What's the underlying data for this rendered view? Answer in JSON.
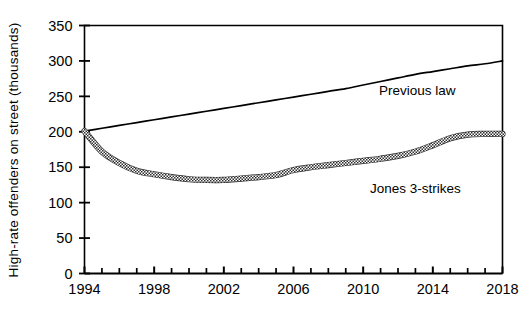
{
  "chart_data": {
    "type": "line",
    "title": "",
    "xlabel": "",
    "ylabel": "High-rate offenders on street (thousands)",
    "xlim": [
      1994,
      2018
    ],
    "ylim": [
      0,
      350
    ],
    "grid": false,
    "legend_position": "inline-annotation",
    "y_ticks": [
      0,
      50,
      100,
      150,
      200,
      250,
      300,
      350
    ],
    "y_tick_labels": [
      "0",
      "50",
      "100",
      "150",
      "200",
      "250",
      "300",
      "350"
    ],
    "x_ticks": [
      1994,
      1995,
      1996,
      1997,
      1998,
      1999,
      2000,
      2001,
      2002,
      2003,
      2004,
      2005,
      2006,
      2007,
      2008,
      2009,
      2010,
      2011,
      2012,
      2013,
      2014,
      2015,
      2016,
      2017,
      2018
    ],
    "x_tick_labels": [
      "1994",
      "",
      "",
      "",
      "1998",
      "",
      "",
      "",
      "2002",
      "",
      "",
      "",
      "2006",
      "",
      "",
      "",
      "2010",
      "",
      "",
      "",
      "2014",
      "",
      "",
      "",
      "2018"
    ],
    "x_major_ticks": [
      1994,
      1998,
      2002,
      2006,
      2010,
      2014,
      2018
    ],
    "x": [
      1994,
      1995,
      1996,
      1997,
      1998,
      1999,
      2000,
      2001,
      2002,
      2003,
      2004,
      2005,
      2006,
      2007,
      2008,
      2009,
      2010,
      2011,
      2012,
      2013,
      2014,
      2015,
      2016,
      2017,
      2018
    ],
    "series": [
      {
        "name": "Previous law",
        "style": "thin-solid",
        "color": "#000000",
        "label_x": 2013.1,
        "label_y": 252,
        "values": [
          201,
          205,
          209,
          213,
          217,
          221,
          225,
          229,
          233,
          237,
          241,
          245,
          249,
          253,
          257,
          261,
          266,
          271,
          276,
          281,
          285,
          289,
          293,
          296,
          300
        ]
      },
      {
        "name": "Jones 3-strikes",
        "style": "thick-textured",
        "color": "#3a3a3a",
        "label_x": 2013.0,
        "label_y": 113,
        "values": [
          201,
          172,
          156,
          145,
          140,
          136,
          133,
          132,
          132,
          134,
          136,
          139,
          146,
          150,
          153,
          156,
          159,
          162,
          166,
          172,
          181,
          191,
          196,
          197,
          197
        ]
      }
    ]
  },
  "annotations": {
    "previous_law_label": "Previous law",
    "jones_label": "Jones 3-strikes"
  }
}
